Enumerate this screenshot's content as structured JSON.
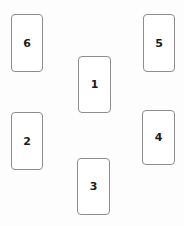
{
  "canvas": {
    "width": 184,
    "height": 226,
    "background_color": "#fdfdfd"
  },
  "style": {
    "card_fill": "#ffffff",
    "card_border_color": "#8d8d8d",
    "label_color": "#1b1b1b"
  },
  "cards": [
    {
      "label": "6",
      "position_name": "top-left",
      "x": 11,
      "y": 14,
      "width": 32,
      "height": 58
    },
    {
      "label": "5",
      "position_name": "top-right",
      "x": 143,
      "y": 14,
      "width": 32,
      "height": 58
    },
    {
      "label": "1",
      "position_name": "center-upper",
      "x": 78,
      "y": 56,
      "width": 33,
      "height": 57
    },
    {
      "label": "2",
      "position_name": "bottom-left",
      "x": 11,
      "y": 112,
      "width": 32,
      "height": 58
    },
    {
      "label": "4",
      "position_name": "bottom-right",
      "x": 142,
      "y": 110,
      "width": 33,
      "height": 55
    },
    {
      "label": "3",
      "position_name": "center-lower",
      "x": 77,
      "y": 158,
      "width": 33,
      "height": 57
    }
  ]
}
